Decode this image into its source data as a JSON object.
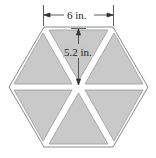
{
  "diagram": {
    "shape": "regular hexagon divided into 6 equilateral triangles",
    "width_label": "6 in.",
    "height_label": "5.2 in.",
    "fill_color": "#c9c9c9",
    "gap_color": "#ffffff",
    "outline_color": "#8a8a8a"
  }
}
